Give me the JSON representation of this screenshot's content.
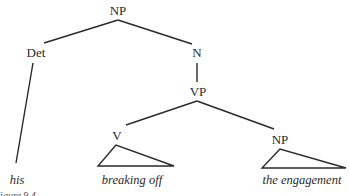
{
  "tree": {
    "root": {
      "label": "NP"
    },
    "det": {
      "label": "Det"
    },
    "n": {
      "label": "N"
    },
    "vp": {
      "label": "VP"
    },
    "v": {
      "label": "V"
    },
    "np2": {
      "label": "NP"
    }
  },
  "leaves": {
    "his": "his",
    "breaking_off": "breaking off",
    "the_engagement": "the engagement"
  },
  "caption": "Figure 9.4"
}
